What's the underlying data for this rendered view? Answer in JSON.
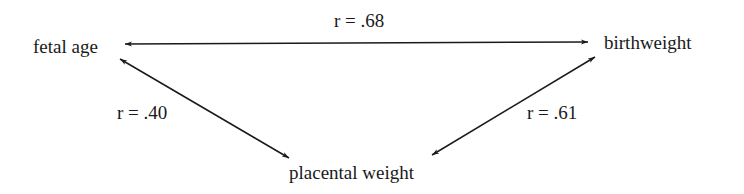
{
  "diagram": {
    "nodes": [
      {
        "id": "fetal_age",
        "label": "fetal age"
      },
      {
        "id": "birthweight",
        "label": "birthweight"
      },
      {
        "id": "placental_weight",
        "label": "placental weight"
      }
    ],
    "edges": [
      {
        "from": "fetal_age",
        "to": "birthweight",
        "label": "r = .68",
        "bidirectional": true
      },
      {
        "from": "fetal_age",
        "to": "placental_weight",
        "label": "r = .40",
        "bidirectional": true
      },
      {
        "from": "birthweight",
        "to": "placental_weight",
        "label": "r = .61",
        "bidirectional": true
      }
    ],
    "colors": {
      "line": "#1a1a1a",
      "background": "#ffffff"
    }
  }
}
